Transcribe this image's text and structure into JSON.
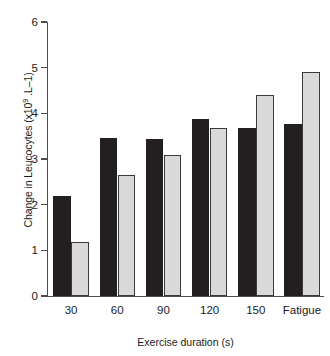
{
  "chart_data": {
    "type": "bar",
    "title": "",
    "xlabel": "Exercise duration (s)",
    "ylabel": "Change in Leucocytes (x109 .L–1)",
    "ylabel_parts": {
      "prefix": "Change in Leucocytes (x10",
      "sup": "9",
      "suffix": " .L–1)"
    },
    "categories": [
      "30",
      "60",
      "90",
      "120",
      "150",
      "Fatigue"
    ],
    "series": [
      {
        "name": "dark",
        "color": "#231f20",
        "values": [
          2.19,
          3.46,
          3.44,
          3.87,
          3.68,
          3.77
        ]
      },
      {
        "name": "light",
        "color": "#d9d9d9",
        "values": [
          1.18,
          2.65,
          3.08,
          3.67,
          4.4,
          4.9
        ]
      }
    ],
    "ylim": [
      0,
      6
    ],
    "yticks": [
      0,
      1,
      2,
      3,
      4,
      5,
      6
    ],
    "ytick_labels": [
      "0",
      "1",
      "2",
      "3",
      "4",
      "5",
      "6"
    ],
    "grid": false,
    "legend": null,
    "axis_color": "#4d4d4d",
    "background": "#ffffff"
  }
}
